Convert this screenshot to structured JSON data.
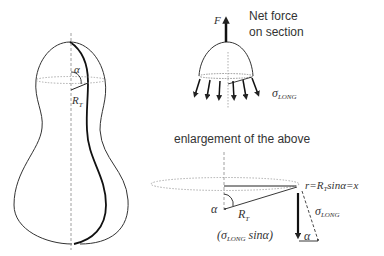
{
  "figure": {
    "left_shape": {
      "angle_label": "α",
      "radius_label": "R",
      "radius_subscript": "T"
    },
    "top_panel": {
      "force_label": "F",
      "net_force_line1": "Net force",
      "net_force_line2": "on section",
      "stress_label": "σ",
      "stress_subscript": "LONG"
    },
    "bottom_panel": {
      "title": "enlargement of the above",
      "equation_r": "r",
      "equation_eq1": "=R",
      "equation_sub": "T",
      "equation_rest": "sinα=x",
      "angle_label": "α",
      "radius_label": "R",
      "radius_subscript": "T",
      "stress_label": "σ",
      "stress_subscript": "LONG",
      "component_open": "(σ",
      "component_subscript": "LONG",
      "component_close": " sinα)",
      "angle_label_bottom": "α"
    },
    "colors": {
      "stroke": "#222222",
      "dotted": "#888888",
      "text": "#333333"
    }
  }
}
